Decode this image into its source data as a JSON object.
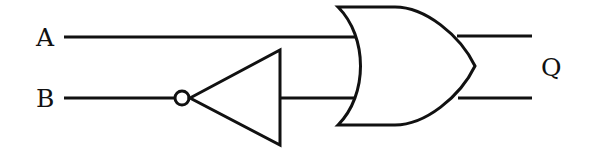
{
  "diagram": {
    "type": "logic-circuit",
    "inputs": [
      {
        "label": "A"
      },
      {
        "label": "B"
      }
    ],
    "output": {
      "label": "Q"
    },
    "gates": [
      {
        "type": "NOT",
        "input": "B"
      },
      {
        "type": "OR",
        "inputs": [
          "A",
          "NOT B"
        ]
      }
    ],
    "colors": {
      "stroke": "#111111",
      "background": "#ffffff"
    }
  }
}
